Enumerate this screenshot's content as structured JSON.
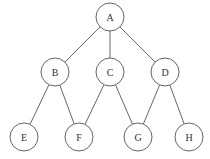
{
  "diagram": {
    "type": "graph",
    "width": 210,
    "height": 159,
    "node_radius": 14,
    "colors": {
      "stroke": "#555555",
      "fill": "#ffffff",
      "text": "#333333"
    },
    "nodes": [
      {
        "id": "A",
        "label": "A",
        "x": 110,
        "y": 17
      },
      {
        "id": "B",
        "label": "B",
        "x": 55,
        "y": 72
      },
      {
        "id": "C",
        "label": "C",
        "x": 110,
        "y": 72
      },
      {
        "id": "D",
        "label": "D",
        "x": 165,
        "y": 72
      },
      {
        "id": "E",
        "label": "E",
        "x": 24,
        "y": 137
      },
      {
        "id": "F",
        "label": "F",
        "x": 79,
        "y": 137
      },
      {
        "id": "G",
        "label": "G",
        "x": 138,
        "y": 137
      },
      {
        "id": "H",
        "label": "H",
        "x": 189,
        "y": 137
      }
    ],
    "edges": [
      {
        "from": "A",
        "to": "B"
      },
      {
        "from": "A",
        "to": "C"
      },
      {
        "from": "A",
        "to": "D"
      },
      {
        "from": "B",
        "to": "E"
      },
      {
        "from": "B",
        "to": "F"
      },
      {
        "from": "C",
        "to": "F"
      },
      {
        "from": "C",
        "to": "G"
      },
      {
        "from": "D",
        "to": "G"
      },
      {
        "from": "D",
        "to": "H"
      }
    ]
  }
}
